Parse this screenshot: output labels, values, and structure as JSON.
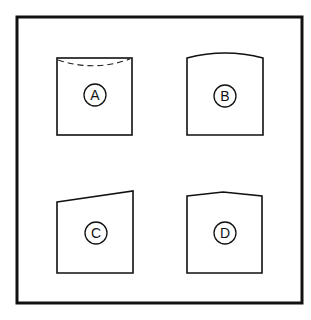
{
  "figure": {
    "stroke_color": "#111111",
    "background": "#ffffff",
    "panels": [
      {
        "label": "A",
        "shape": "square with dashed curved line near top edge"
      },
      {
        "label": "B",
        "shape": "square with convex curved top edge"
      },
      {
        "label": "C",
        "shape": "quadrilateral with top edge sloping up to the right"
      },
      {
        "label": "D",
        "shape": "square with peaked (gabled) top edge"
      }
    ]
  }
}
